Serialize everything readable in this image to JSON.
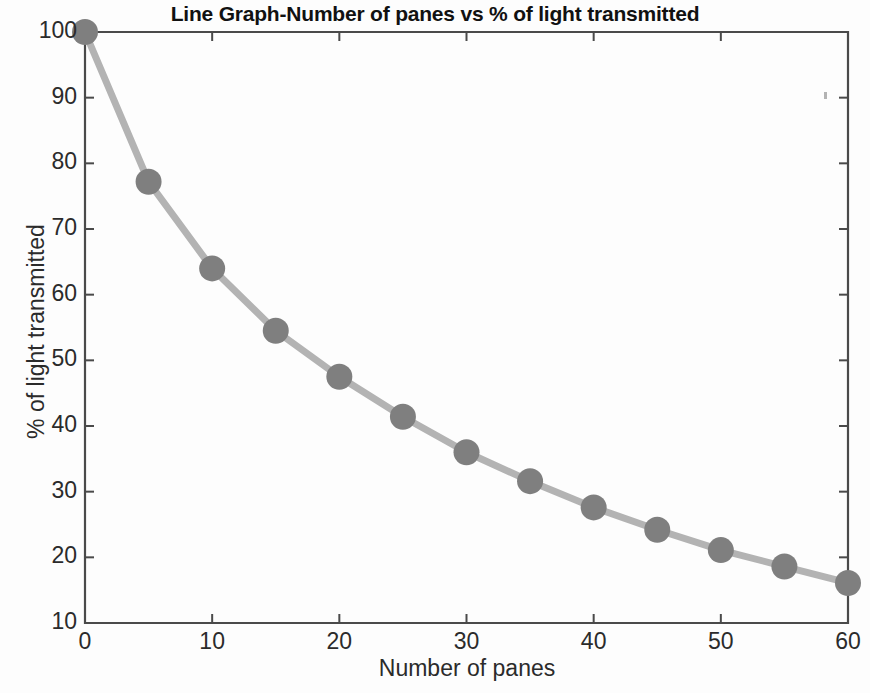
{
  "chart_data": {
    "type": "line",
    "title": "Line Graph-Number of panes vs % of light transmitted",
    "xlabel": "Number of panes",
    "ylabel": "% of light transmitted",
    "x": [
      0,
      5,
      10,
      15,
      20,
      25,
      30,
      35,
      40,
      45,
      50,
      55,
      60
    ],
    "values": [
      100,
      77.2,
      64,
      54.5,
      47.5,
      41.4,
      36,
      31.6,
      27.6,
      24.2,
      21.1,
      18.6,
      16.1
    ],
    "xlim": [
      0,
      60
    ],
    "ylim": [
      10,
      100
    ],
    "xticks": [
      0,
      10,
      20,
      30,
      40,
      50,
      60
    ],
    "yticks": [
      10,
      20,
      30,
      40,
      50,
      60,
      70,
      80,
      90,
      100
    ],
    "xtick_labels": [
      "0",
      "10",
      "20",
      "30",
      "40",
      "50",
      "60"
    ],
    "ytick_labels": [
      "10",
      "20",
      "30",
      "40",
      "50",
      "60",
      "70",
      "80",
      "90",
      "100"
    ],
    "grid": false,
    "legend": null,
    "marker": "circle",
    "marker_size": 26,
    "line_width": 7,
    "line_color": "#b3b3b3",
    "marker_color": "#7f7f7f",
    "axis_color": "#4a4a4a",
    "background_color": "#fdfdfd"
  }
}
